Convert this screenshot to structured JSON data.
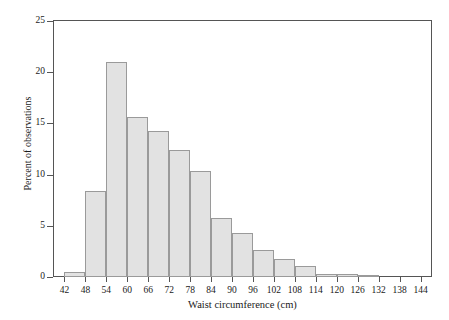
{
  "chart_data": {
    "type": "bar",
    "title": "",
    "subtitle": "",
    "xlabel": "Waist circumference (cm)",
    "ylabel": "Percent of observations",
    "grid": false,
    "legend": false,
    "bin_width": 6,
    "xlim": [
      39,
      147
    ],
    "ylim": [
      0,
      25
    ],
    "yticks": [
      0,
      5,
      10,
      15,
      20,
      25
    ],
    "ytick_labels": [
      "0",
      "5",
      "10",
      "15",
      "20",
      "25"
    ],
    "xticks": [
      42,
      48,
      54,
      60,
      66,
      72,
      78,
      84,
      90,
      96,
      102,
      108,
      114,
      120,
      126,
      132,
      138,
      144
    ],
    "xtick_labels": [
      "42",
      "48",
      "54",
      "60",
      "66",
      "72",
      "78",
      "84",
      "90",
      "96",
      "102",
      "108",
      "114",
      "120",
      "126",
      "132",
      "138",
      "144"
    ],
    "bin_edges": [
      42,
      48,
      54,
      60,
      66,
      72,
      78,
      84,
      90,
      96,
      102,
      108,
      114,
      120,
      126,
      132
    ],
    "categories": [
      "42-48",
      "48-54",
      "54-60",
      "60-66",
      "66-72",
      "72-78",
      "78-84",
      "84-90",
      "90-96",
      "96-102",
      "102-108",
      "108-114",
      "114-120",
      "120-126",
      "126-132"
    ],
    "values": [
      0.5,
      8.4,
      21.0,
      15.6,
      14.3,
      12.4,
      10.4,
      5.8,
      4.3,
      2.6,
      1.8,
      1.1,
      0.25,
      0.25,
      0.2
    ],
    "bar_fill_color": "#e2e2e2",
    "bar_edge_color": "#9a9a9a",
    "axis_color": "#555555",
    "background_color": "#ffffff"
  }
}
